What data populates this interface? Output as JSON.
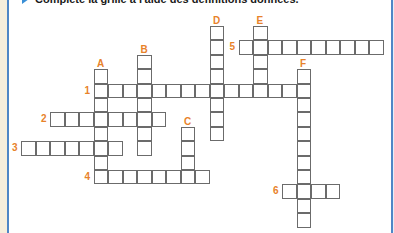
{
  "instruction": {
    "icon": "arrow-right-icon",
    "text": "Complète la grille à l'aide des définitions données."
  },
  "grid": {
    "origin_x": 21,
    "origin_y": 26,
    "cell_w": 14.5,
    "cell_h": 14.4,
    "label_color": "#e8822a",
    "border_color": "#4f86c6"
  },
  "words": [
    {
      "label": "1",
      "direction": "across",
      "row": 4,
      "col": 5,
      "length": 15
    },
    {
      "label": "2",
      "direction": "across",
      "row": 6,
      "col": 2,
      "length": 8
    },
    {
      "label": "3",
      "direction": "across",
      "row": 8,
      "col": 0,
      "length": 7
    },
    {
      "label": "4",
      "direction": "across",
      "row": 10,
      "col": 5,
      "length": 8
    },
    {
      "label": "5",
      "direction": "across",
      "row": 1,
      "col": 15,
      "length": 10
    },
    {
      "label": "6",
      "direction": "across",
      "row": 11,
      "col": 18,
      "length": 4
    },
    {
      "label": "A",
      "direction": "down",
      "row": 3,
      "col": 5,
      "length": 8
    },
    {
      "label": "B",
      "direction": "down",
      "row": 2,
      "col": 8,
      "length": 7
    },
    {
      "label": "C",
      "direction": "down",
      "row": 7,
      "col": 11,
      "length": 4
    },
    {
      "label": "D",
      "direction": "down",
      "row": 0,
      "col": 13,
      "length": 8
    },
    {
      "label": "E",
      "direction": "down",
      "row": 0,
      "col": 16,
      "length": 5
    },
    {
      "label": "F",
      "direction": "down",
      "row": 3,
      "col": 19,
      "length": 11
    }
  ]
}
